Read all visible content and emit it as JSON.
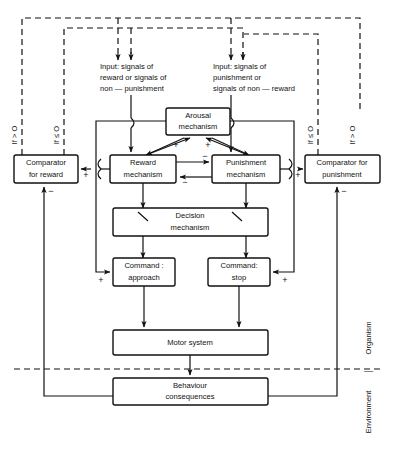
{
  "diagram": {
    "boxes": {
      "arousal": {
        "line1": "Arousal",
        "line2": "mechanism"
      },
      "reward_mech": {
        "line1": "Reward",
        "line2": "mechanism"
      },
      "punishment_mech": {
        "line1": "Punishment",
        "line2": "mechanism"
      },
      "comparator_reward": {
        "line1": "Comparator",
        "line2": "for  reward"
      },
      "comparator_punishment": {
        "line1": "Comparator  for",
        "line2": "punishment"
      },
      "decision": {
        "line1": "Decision",
        "line2": "mechanism"
      },
      "command_approach": {
        "line1": "Command :",
        "line2": "approach"
      },
      "command_stop": {
        "line1": "Command:",
        "line2": "stop"
      },
      "motor": {
        "line1": "Motor system",
        "line2": ""
      },
      "behaviour": {
        "line1": "Behaviour",
        "line2": "consequences"
      }
    },
    "inputs": {
      "left": {
        "l1": "Input: signals of",
        "l2": "reward or signals of",
        "l3": "non — punishment"
      },
      "right": {
        "l1": "Input: signals of",
        "l2": "punishment or",
        "l3": "signals of non — reward"
      }
    },
    "conditions": {
      "far_left": "If > O",
      "inner_left": "If ≤ O",
      "inner_right": "If ≤ O",
      "far_right": "If > O"
    },
    "boundary": {
      "label_left": "Environment",
      "label_right": "Organism",
      "separator": "│"
    },
    "signs": {
      "arousal_plus_left": "+",
      "arousal_plus_right": "+",
      "reward_to_comparator_plus": "+",
      "punish_to_comparator_plus": "+",
      "reward_to_punish_minus": "−",
      "punish_to_reward_minus": "−",
      "comparator_reward_minus": "−",
      "comparator_punishment_minus": "−",
      "approach_plus": "+",
      "stop_plus": "+"
    },
    "colors": {
      "stroke": "#111111",
      "background": "#ffffff"
    }
  }
}
